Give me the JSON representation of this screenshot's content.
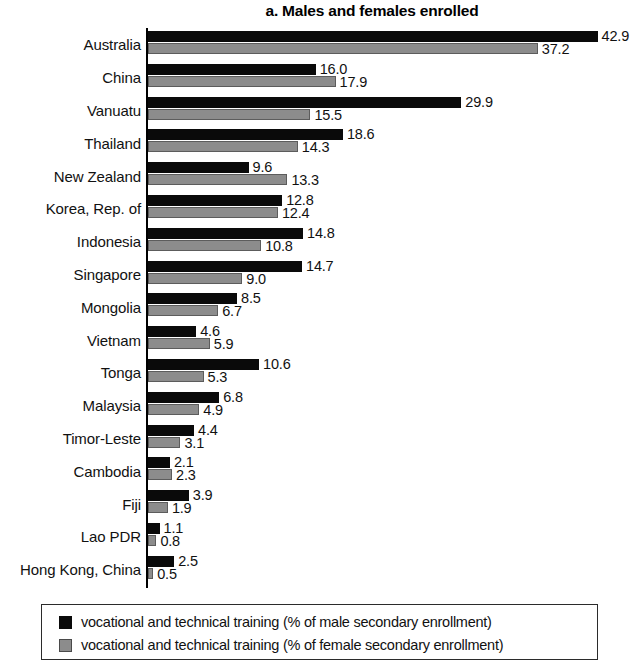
{
  "chart_data": {
    "type": "bar",
    "orientation": "horizontal",
    "title": "a. Males and females enrolled",
    "xlabel": "",
    "ylabel": "",
    "xlim": [
      0,
      42.9
    ],
    "grid": false,
    "legend_position": "bottom",
    "categories": [
      "Australia",
      "China",
      "Vanuatu",
      "Thailand",
      "New Zealand",
      "Korea, Rep. of",
      "Indonesia",
      "Singapore",
      "Mongolia",
      "Vietnam",
      "Tonga",
      "Malaysia",
      "Timor-Leste",
      "Cambodia",
      "Fiji",
      "Lao PDR",
      "Hong Kong, China"
    ],
    "series": [
      {
        "name": "vocational and technical training (% of male secondary enrollment)",
        "color": "#0a0a0a",
        "values": [
          42.9,
          16.0,
          29.9,
          18.6,
          9.6,
          12.8,
          14.8,
          14.7,
          8.5,
          4.6,
          10.6,
          6.8,
          4.4,
          2.1,
          3.9,
          1.1,
          2.5
        ],
        "labels": [
          "42.9",
          "16.0",
          "29.9",
          "18.6",
          "9.6",
          "12.8",
          "14.8",
          "14.7",
          "8.5",
          "4.6",
          "10.6",
          "6.8",
          "4.4",
          "2.1",
          "3.9",
          "1.1",
          "2.5"
        ]
      },
      {
        "name": "vocational and technical training (% of female secondary enrollment)",
        "color": "#8c8c8c",
        "values": [
          37.2,
          17.9,
          15.5,
          14.3,
          13.3,
          12.4,
          10.8,
          9.0,
          6.7,
          5.9,
          5.3,
          4.9,
          3.1,
          2.3,
          1.9,
          0.8,
          0.5
        ],
        "labels": [
          "37.2",
          "17.9",
          "15.5",
          "14.3",
          "13.3",
          "12.4",
          "10.8",
          "9.0",
          "6.7",
          "5.9",
          "5.3",
          "4.9",
          "3.1",
          "2.3",
          "1.9",
          "0.8",
          "0.5"
        ]
      }
    ]
  },
  "legend": {
    "items": [
      {
        "label": "vocational and technical training (% of male secondary enrollment)",
        "swatch": "male-swatch"
      },
      {
        "label": "vocational and technical training (% of female secondary enrollment)",
        "swatch": "female-swatch"
      }
    ]
  }
}
